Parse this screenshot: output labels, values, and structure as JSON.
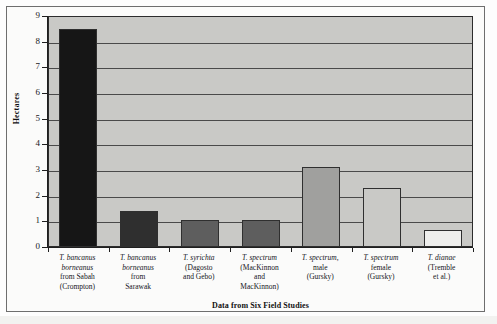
{
  "chart_data": {
    "type": "bar",
    "title": "",
    "xlabel": "Data from Six Field Studies",
    "ylabel": "Hectares",
    "ylim": [
      0,
      9
    ],
    "ytick_values": [
      0,
      1,
      2,
      3,
      4,
      5,
      6,
      7,
      8,
      9
    ],
    "ytick_labels": [
      "0",
      "1",
      "2",
      "3",
      "4",
      "5",
      "6",
      "7",
      "8",
      "9"
    ],
    "grid": "horizontal",
    "legend": "none",
    "categories": [
      "T. bancanus borneanus from Sabah (Crompton)",
      "T. bancanus borneanus from Sarawak",
      "T. syrichta (Dagosto and Gebo)",
      "T. spectrum (MacKinnon and MacKinnon)",
      "T. spectrum, male (Gursky)",
      "T. spectrum female (Gursky)",
      "T. dianae (Tremble et al.)"
    ],
    "category_lines": [
      [
        "T. bancanus",
        "borneanus",
        "from Sabah",
        "(Crompton)"
      ],
      [
        "T. bancanus",
        "borneanus",
        "from",
        "Sarawak"
      ],
      [
        "T. syrichta",
        "(Dagosto",
        "and Gebo)"
      ],
      [
        "T. spectrum",
        "(MacKinnon",
        "and",
        "MacKinnon)"
      ],
      [
        "T. spectrum,",
        "male",
        "(Gursky)"
      ],
      [
        "T. spectrum",
        "female",
        "(Gursky)"
      ],
      [
        "T. dianae",
        "(Tremble",
        "et al.)"
      ]
    ],
    "values": [
      8.5,
      1.4,
      1.05,
      1.05,
      3.1,
      2.3,
      0.65
    ],
    "bar_colors": [
      "#161616",
      "#2f2f2f",
      "#5e5e5e",
      "#5e5e5e",
      "#a0a09e",
      "#c9c9c6",
      "#eeeeec"
    ],
    "plot_background": "#c9c9c6",
    "gridline_color": "#4a4a4a",
    "axis_color": "#1f1f1f"
  }
}
